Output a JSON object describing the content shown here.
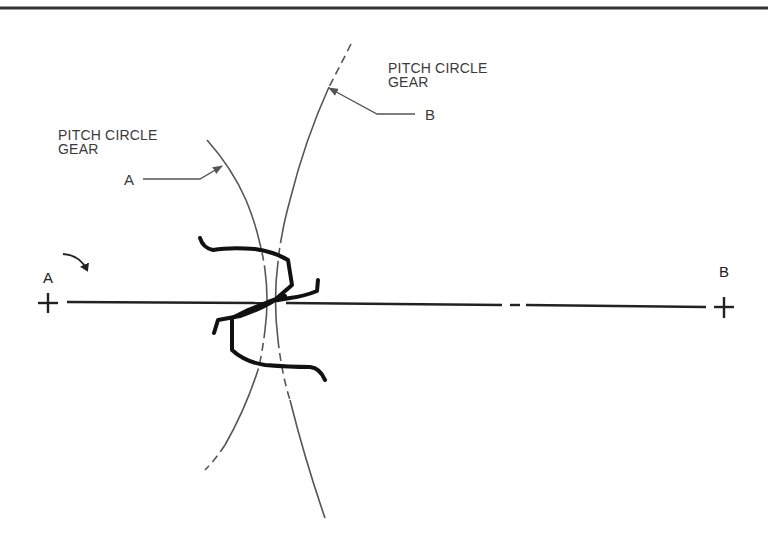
{
  "diagram": {
    "labels": {
      "gear_b_callout_line1": "PITCH CIRCLE",
      "gear_b_callout_line2": "GEAR",
      "gear_b_callout_letter": "B",
      "gear_a_callout_line1": "PITCH CIRCLE",
      "gear_a_callout_line2": "GEAR",
      "gear_a_callout_letter": "A",
      "center_a": "A",
      "center_b": "B"
    },
    "elements": {
      "gear_a_center": {
        "x": 48,
        "y": 302,
        "symbol": "+"
      },
      "gear_b_center": {
        "x": 724,
        "y": 307,
        "symbol": "+"
      },
      "center_line": {
        "from": [
          67,
          302
        ],
        "to": [
          706,
          307
        ],
        "style": "dash-dot"
      },
      "rotation_arrow": {
        "direction": "clockwise",
        "near": "gear A center"
      },
      "pitch_circle_a": {
        "style": "solid/dashed",
        "bulges": "right"
      },
      "pitch_circle_b": {
        "style": "solid/dashed",
        "bulges": "left"
      },
      "gear_teeth": {
        "count_visible": 3,
        "meshing_at": [
          272,
          302
        ]
      }
    },
    "colors": {
      "line": "#555555",
      "teeth": "#111111",
      "text": "#3a3a3a",
      "border": "#333333"
    }
  }
}
